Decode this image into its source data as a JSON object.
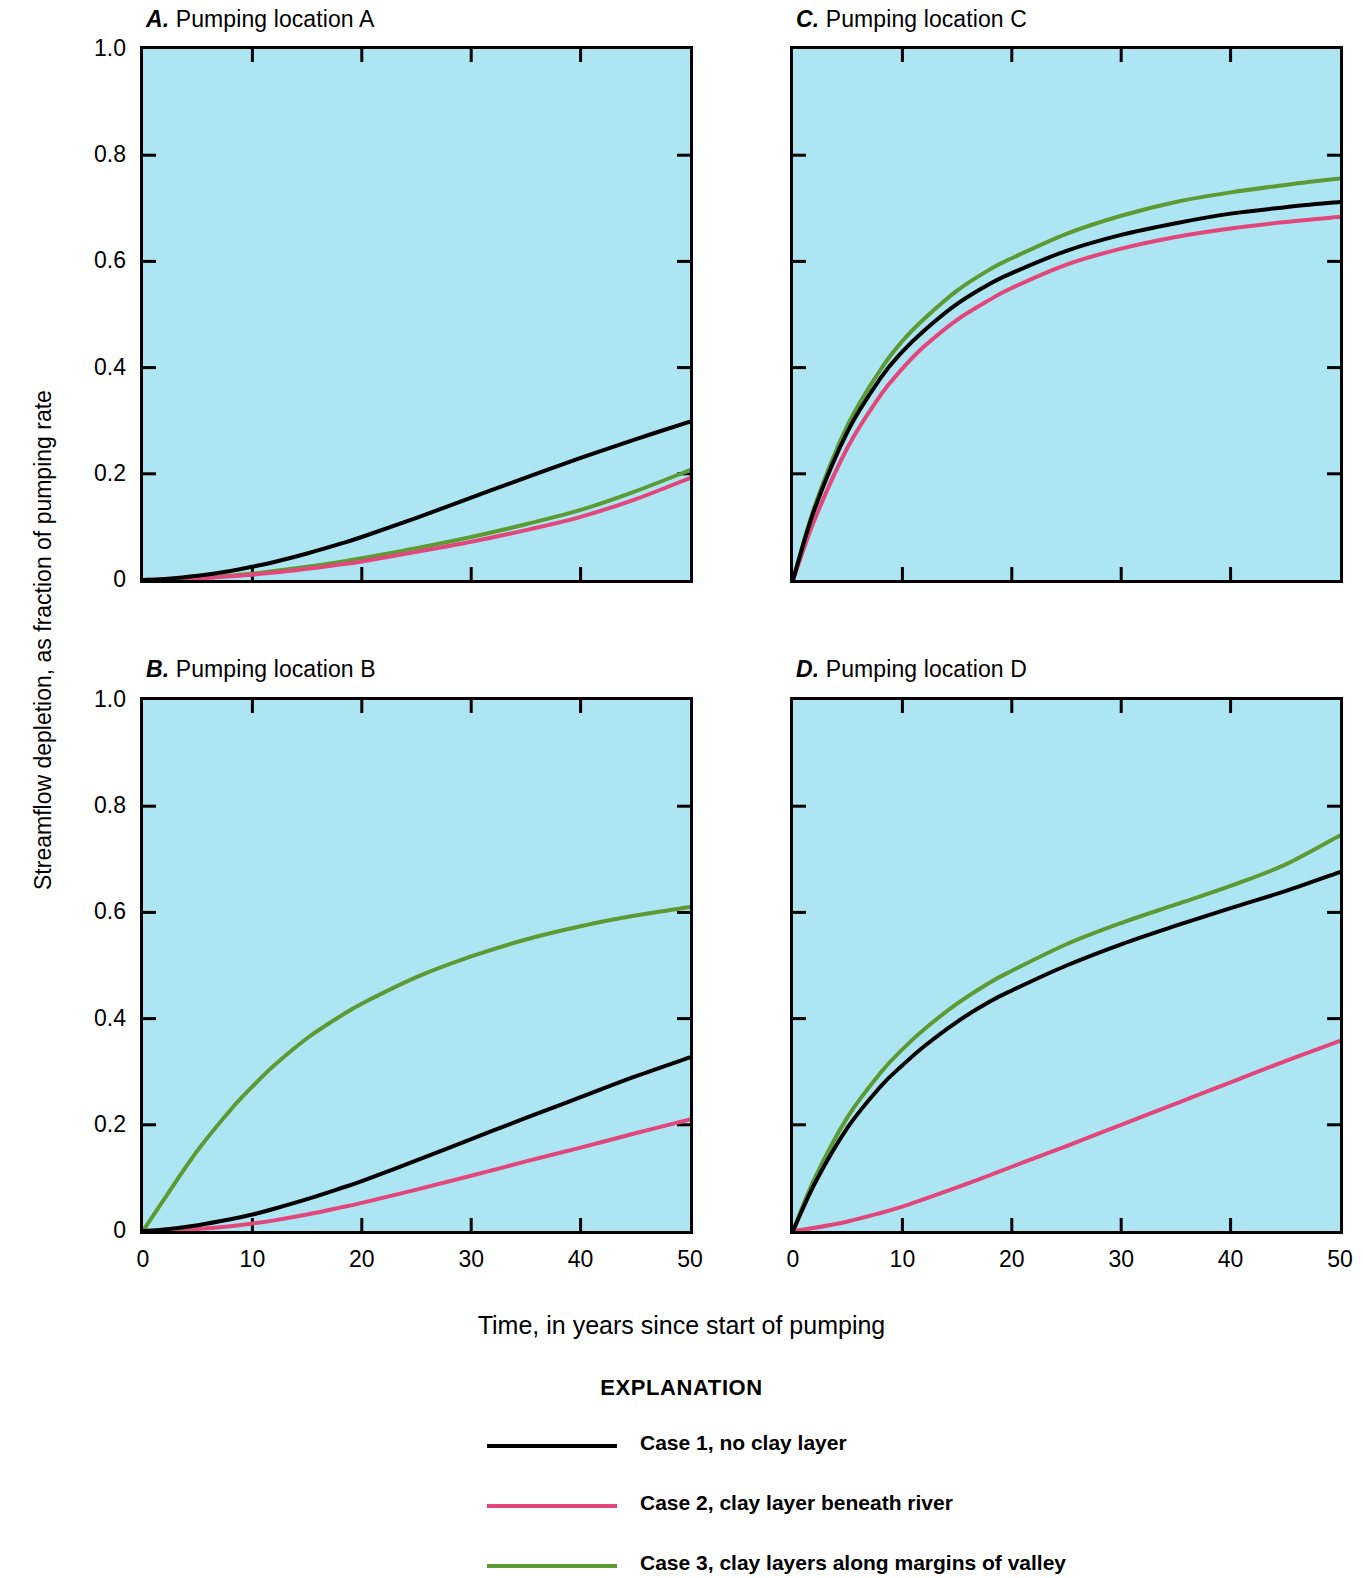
{
  "figure": {
    "ylabel": "Streamflow depletion, as fraction of pumping rate",
    "xlabel": "Time, in years since start of pumping",
    "explanation_title": "EXPLANATION",
    "plot_background_color": "#ADE6F2",
    "axis_color": "#000000"
  },
  "legend": {
    "items": [
      {
        "label": "Case 1, no clay layer",
        "color": "#000000"
      },
      {
        "label": "Case 2, clay layer beneath river",
        "color": "#E2467A"
      },
      {
        "label": "Case 3, clay layers along margins of valley",
        "color": "#5C9B34"
      }
    ]
  },
  "axes": {
    "y_ticks": [
      "1.0",
      "0.8",
      "0.6",
      "0.4",
      "0.2",
      "0"
    ],
    "y_tick_values": [
      1.0,
      0.8,
      0.6,
      0.4,
      0.2,
      0
    ],
    "x_ticks": [
      "0",
      "10",
      "20",
      "30",
      "40",
      "50"
    ],
    "x_tick_values": [
      0,
      10,
      20,
      30,
      40,
      50
    ],
    "xlim": [
      0,
      50
    ],
    "ylim": [
      0,
      1.0
    ]
  },
  "panels": [
    {
      "id": "A",
      "letter": "A.",
      "title": "Pumping location A"
    },
    {
      "id": "B",
      "letter": "B.",
      "title": "Pumping location B"
    },
    {
      "id": "C",
      "letter": "C.",
      "title": "Pumping location C"
    },
    {
      "id": "D",
      "letter": "D.",
      "title": "Pumping location D"
    }
  ],
  "chart_data": [
    {
      "type": "line",
      "panel": "A",
      "title": "A. Pumping location A",
      "xlabel": "Time, in years since start of pumping",
      "ylabel": "Streamflow depletion, as fraction of pumping rate",
      "xlim": [
        0,
        50
      ],
      "ylim": [
        0,
        1.0
      ],
      "grid": false,
      "legend_position": "below-figure",
      "x": [
        0,
        2,
        5,
        8,
        10,
        12,
        15,
        18,
        20,
        25,
        30,
        35,
        40,
        45,
        50
      ],
      "series": [
        {
          "name": "Case 1, no clay layer",
          "color": "#000000",
          "values": [
            0.0,
            0.002,
            0.008,
            0.017,
            0.025,
            0.034,
            0.05,
            0.068,
            0.081,
            0.117,
            0.155,
            0.193,
            0.23,
            0.265,
            0.298
          ]
        },
        {
          "name": "Case 2, clay layer beneath river",
          "color": "#E2467A",
          "values": [
            0.0,
            0.001,
            0.003,
            0.007,
            0.01,
            0.014,
            0.021,
            0.029,
            0.035,
            0.053,
            0.072,
            0.094,
            0.119,
            0.152,
            0.192
          ]
        },
        {
          "name": "Case 3, clay layers along margins of valley",
          "color": "#5C9B34",
          "values": [
            0.0,
            0.001,
            0.004,
            0.008,
            0.012,
            0.017,
            0.025,
            0.034,
            0.041,
            0.06,
            0.081,
            0.105,
            0.132,
            0.167,
            0.207
          ]
        }
      ]
    },
    {
      "type": "line",
      "panel": "B",
      "title": "B. Pumping location B",
      "xlabel": "Time, in years since start of pumping",
      "ylabel": "Streamflow depletion, as fraction of pumping rate",
      "xlim": [
        0,
        50
      ],
      "ylim": [
        0,
        1.0
      ],
      "grid": false,
      "legend_position": "below-figure",
      "x": [
        0,
        2,
        5,
        8,
        10,
        12,
        15,
        18,
        20,
        25,
        30,
        35,
        40,
        45,
        50
      ],
      "series": [
        {
          "name": "Case 1, no clay layer",
          "color": "#000000",
          "values": [
            0.0,
            0.003,
            0.011,
            0.022,
            0.031,
            0.042,
            0.06,
            0.08,
            0.094,
            0.133,
            0.173,
            0.213,
            0.252,
            0.291,
            0.327
          ]
        },
        {
          "name": "Case 2, clay layer beneath river",
          "color": "#E2467A",
          "values": [
            0.0,
            0.001,
            0.004,
            0.009,
            0.014,
            0.02,
            0.031,
            0.044,
            0.053,
            0.078,
            0.104,
            0.131,
            0.157,
            0.184,
            0.21
          ]
        },
        {
          "name": "Case 3, clay layers along margins of valley",
          "color": "#5C9B34",
          "values": [
            0.0,
            0.062,
            0.152,
            0.228,
            0.272,
            0.312,
            0.363,
            0.404,
            0.428,
            0.478,
            0.517,
            0.549,
            0.574,
            0.594,
            0.61
          ]
        }
      ]
    },
    {
      "type": "line",
      "panel": "C",
      "title": "C. Pumping location C",
      "xlabel": "Time, in years since start of pumping",
      "ylabel": "Streamflow depletion, as fraction of pumping rate",
      "xlim": [
        0,
        50
      ],
      "ylim": [
        0,
        1.0
      ],
      "grid": false,
      "legend_position": "below-figure",
      "x": [
        0,
        2,
        5,
        8,
        10,
        12,
        15,
        18,
        20,
        25,
        30,
        35,
        40,
        45,
        50
      ],
      "series": [
        {
          "name": "Case 1, no clay layer",
          "color": "#000000",
          "values": [
            0.0,
            0.135,
            0.28,
            0.38,
            0.43,
            0.47,
            0.52,
            0.558,
            0.578,
            0.62,
            0.65,
            0.672,
            0.69,
            0.702,
            0.712
          ]
        },
        {
          "name": "Case 2, clay layer beneath river",
          "color": "#E2467A",
          "values": [
            0.0,
            0.115,
            0.25,
            0.348,
            0.398,
            0.44,
            0.49,
            0.528,
            0.55,
            0.594,
            0.624,
            0.646,
            0.662,
            0.674,
            0.684
          ]
        },
        {
          "name": "Case 3, clay layers along margins of valley",
          "color": "#5C9B34",
          "values": [
            0.0,
            0.14,
            0.292,
            0.396,
            0.45,
            0.492,
            0.545,
            0.585,
            0.606,
            0.652,
            0.686,
            0.712,
            0.73,
            0.744,
            0.756
          ]
        }
      ]
    },
    {
      "type": "line",
      "panel": "D",
      "title": "D. Pumping location D",
      "xlabel": "Time, in years since start of pumping",
      "ylabel": "Streamflow depletion, as fraction of pumping rate",
      "xlim": [
        0,
        50
      ],
      "ylim": [
        0,
        1.0
      ],
      "grid": false,
      "legend_position": "below-figure",
      "x": [
        0,
        2,
        5,
        8,
        10,
        12,
        15,
        18,
        20,
        25,
        30,
        35,
        40,
        45,
        50
      ],
      "series": [
        {
          "name": "Case 1, no clay layer",
          "color": "#000000",
          "values": [
            0.0,
            0.09,
            0.195,
            0.272,
            0.312,
            0.348,
            0.394,
            0.432,
            0.453,
            0.5,
            0.54,
            0.575,
            0.608,
            0.64,
            0.676
          ]
        },
        {
          "name": "Case 2, clay layer beneath river",
          "color": "#E2467A",
          "values": [
            0.0,
            0.006,
            0.018,
            0.034,
            0.046,
            0.06,
            0.082,
            0.105,
            0.121,
            0.16,
            0.2,
            0.24,
            0.28,
            0.32,
            0.358
          ]
        },
        {
          "name": "Case 3, clay layers along margins of valley",
          "color": "#5C9B34",
          "values": [
            0.0,
            0.1,
            0.215,
            0.298,
            0.342,
            0.38,
            0.428,
            0.468,
            0.49,
            0.54,
            0.58,
            0.615,
            0.65,
            0.69,
            0.745
          ]
        }
      ]
    }
  ]
}
